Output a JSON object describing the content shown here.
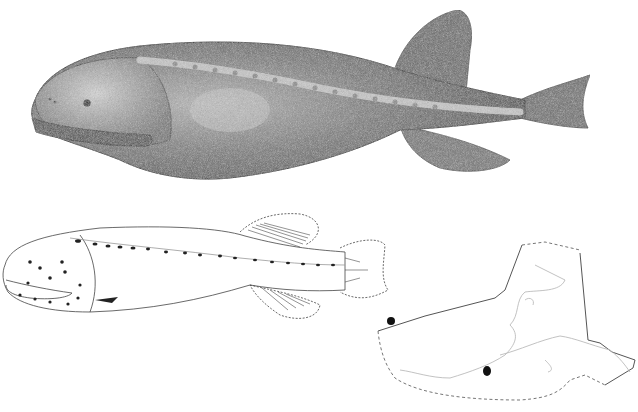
{
  "figure": {
    "panels": [
      {
        "id": "shaded-lateral-view",
        "description": "Stippled shaded drawing of fish, lateral view, facing left"
      },
      {
        "id": "outline-lateral-view",
        "description": "Line drawing of fish showing lateral-line pores, facing left"
      },
      {
        "id": "range-map",
        "description": "Outline map of Alaska with dashed EEZ boundary and occurrence dots"
      }
    ],
    "map": {
      "occurrence_points": 2,
      "colors": {
        "ink": "#222222",
        "coast": "#bbbbbb",
        "boundary": "#555555"
      }
    },
    "colors": {
      "background": "#ffffff",
      "body_shade": "#6e6e6e",
      "body_light": "#b5b5b5",
      "outline": "#444444"
    }
  }
}
